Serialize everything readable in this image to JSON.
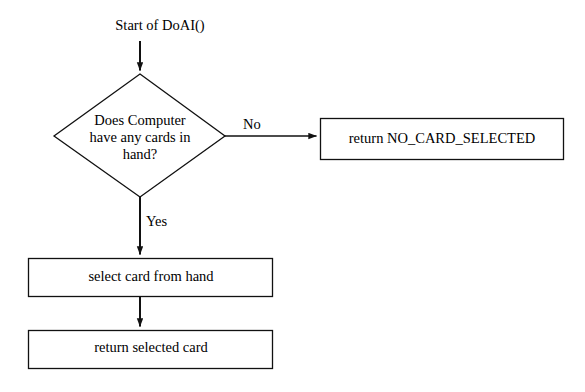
{
  "diagram": {
    "background_color": "#ffffff",
    "stroke_color": "#000000",
    "text_color": "#000000",
    "nodes": {
      "start": {
        "type": "terminator-text",
        "label": "Start of DoAI()"
      },
      "decision": {
        "type": "decision",
        "label": "Does Computer\nhave any cards in\nhand?"
      },
      "no_card_selected": {
        "type": "process",
        "label": "return NO_CARD_SELECTED"
      },
      "select_card": {
        "type": "process",
        "label": "select card from hand"
      },
      "return_card": {
        "type": "process",
        "label": "return selected card"
      }
    },
    "edges": {
      "start_to_decision": {
        "label": ""
      },
      "decision_to_no": {
        "label": "No"
      },
      "decision_to_yes": {
        "label": "Yes"
      },
      "select_to_return": {
        "label": ""
      }
    }
  }
}
